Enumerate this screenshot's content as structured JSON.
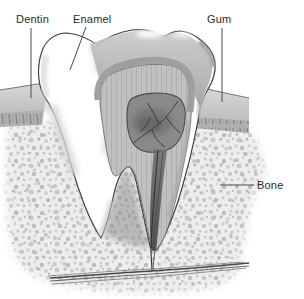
{
  "diagram": {
    "labels": {
      "dentin": "Dentin",
      "enamel": "Enamel",
      "gum": "Gum",
      "bone": "Bone"
    },
    "colors": {
      "label_text": "#2b2b2b",
      "leader_line": "#4a4a4a",
      "outline": "#3f3f3f",
      "enamel_white": "#ffffff",
      "enamel_rim_gray": "#9d9d9d",
      "dentin_gray": "#c3c3c3",
      "pulp_gray": "#898989",
      "nerve_dark": "#383838",
      "gum_gray": "#cbcbcb",
      "bone_speckle_bg": "#ededed",
      "bone_speckle_dot": "#c2c2c2"
    }
  }
}
